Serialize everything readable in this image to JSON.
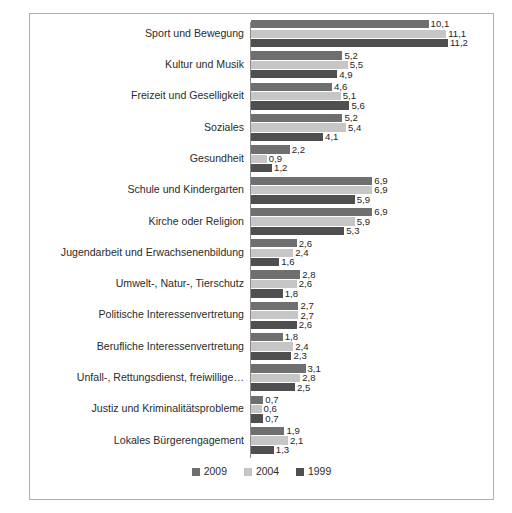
{
  "chart_data": {
    "type": "bar",
    "orientation": "horizontal",
    "title": "",
    "subtitle": "",
    "xlabel": "",
    "ylabel": "",
    "xlim": [
      0,
      11.6
    ],
    "grid": false,
    "legend_position": "bottom",
    "decimal_separator": ",",
    "categories": [
      "Sport und Bewegung",
      "Kultur und Musik",
      "Freizeit und Geselligkeit",
      "Soziales",
      "Gesundheit",
      "Schule und Kindergarten",
      "Kirche oder Religion",
      "Jugendarbeit und Erwachsenenbildung",
      "Umwelt-, Natur-, Tierschutz",
      "Politische Interessenvertretung",
      "Berufliche Interessenvertretung",
      "Unfall-, Rettungsdienst, freiwillige…",
      "Justiz und Kriminalitätsprobleme",
      "Lokales Bürgerengagement"
    ],
    "series": [
      {
        "name": "2009",
        "color": "#6f6f6f",
        "values": [
          10.1,
          5.2,
          4.6,
          5.2,
          2.2,
          6.9,
          6.9,
          2.6,
          2.8,
          2.7,
          1.8,
          3.1,
          0.7,
          1.9
        ],
        "labels": [
          "10,1",
          "5,2",
          "4,6",
          "5,2",
          "2,2",
          "6,9",
          "6,9",
          "2,6",
          "2,8",
          "2,7",
          "1,8",
          "3,1",
          "0,7",
          "1,9"
        ]
      },
      {
        "name": "2004",
        "color": "#c6c6c6",
        "values": [
          11.1,
          5.5,
          5.1,
          5.4,
          0.9,
          6.9,
          5.9,
          2.4,
          2.6,
          2.7,
          2.4,
          2.8,
          0.6,
          2.1
        ],
        "labels": [
          "11,1",
          "5,5",
          "5,1",
          "5,4",
          "0,9",
          "6,9",
          "5,9",
          "2,4",
          "2,6",
          "2,7",
          "2,4",
          "2,8",
          "0,6",
          "2,1"
        ]
      },
      {
        "name": "1999",
        "color": "#4f4f4f",
        "values": [
          11.2,
          4.9,
          5.6,
          4.1,
          1.2,
          5.9,
          5.3,
          1.6,
          1.8,
          2.6,
          2.3,
          2.5,
          0.7,
          1.3
        ],
        "labels": [
          "11,2",
          "4,9",
          "5,6",
          "4,1",
          "1,2",
          "5,9",
          "5,3",
          "1,6",
          "1,8",
          "2,6",
          "2,3",
          "2,5",
          "0,7",
          "1,3"
        ]
      }
    ]
  },
  "legend": {
    "items": [
      {
        "label": "2009",
        "color": "#6f6f6f"
      },
      {
        "label": "2004",
        "color": "#c6c6c6"
      },
      {
        "label": "1999",
        "color": "#4f4f4f"
      }
    ]
  },
  "colors": {
    "series_2009": "#6f6f6f",
    "series_2004": "#c6c6c6",
    "series_1999": "#4f4f4f",
    "border": "#b0b0b0",
    "axis": "#8c8c8c",
    "text": "#2b2b2b",
    "background": "#ffffff"
  }
}
